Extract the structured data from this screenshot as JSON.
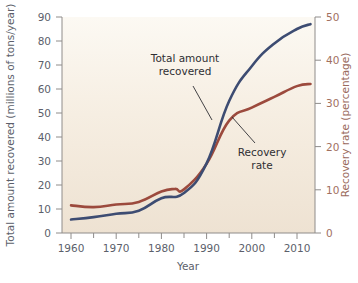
{
  "chart_data": {
    "type": "line",
    "title": "",
    "xlabel": "Year",
    "ylabel": "Total amount recovered (millions of tons/year)",
    "ylabel_right": "Recovery rate (percentage)",
    "xlim": [
      1958,
      2014
    ],
    "ylim": [
      0,
      90
    ],
    "ylim_right": [
      0,
      50
    ],
    "xticks": [
      1960,
      1970,
      1980,
      1990,
      2000,
      2010
    ],
    "xtick_labels": [
      "1960",
      "1970",
      "1980",
      "1990",
      "2000",
      "2010"
    ],
    "xticks_minor": [
      1965,
      1975,
      1985,
      1995,
      2005
    ],
    "yticks": [
      0,
      10,
      20,
      30,
      40,
      50,
      60,
      70,
      80,
      90
    ],
    "ytick_labels": [
      "0",
      "10",
      "20",
      "30",
      "40",
      "50",
      "60",
      "70",
      "80",
      "90"
    ],
    "yticks_right": [
      0,
      10,
      20,
      30,
      40,
      50
    ],
    "ytick_labels_right": [
      "0",
      "10",
      "20",
      "30",
      "40",
      "50"
    ],
    "grid": false,
    "legend_position": "inline-annotations",
    "series": [
      {
        "name": "Total amount recovered",
        "axis": "left",
        "color": "#3d4c72",
        "x": [
          1960,
          1965,
          1970,
          1975,
          1980,
          1985,
          1990,
          1995,
          2000,
          2005,
          2010,
          2013
        ],
        "values": [
          5.6,
          6.6,
          8.0,
          9.3,
          14.5,
          16.7,
          29.0,
          55.0,
          69.5,
          79.0,
          85.0,
          87.0
        ]
      },
      {
        "name": "Recovery rate",
        "axis": "right",
        "color": "#9c4a3d",
        "x": [
          1960,
          1965,
          1970,
          1975,
          1980,
          1983,
          1985,
          1990,
          1995,
          2000,
          2005,
          2010,
          2013
        ],
        "values": [
          6.4,
          6.0,
          6.6,
          7.2,
          9.6,
          10.2,
          10.1,
          16.0,
          26.0,
          29.0,
          31.5,
          34.0,
          34.5
        ]
      }
    ],
    "annotations": [
      {
        "name": "total-amount-recovered",
        "lines": [
          "Total amount",
          "recovered"
        ],
        "text_x": 185,
        "text_y": 62,
        "leader_from": [
          193,
          86
        ],
        "leader_to": [
          212,
          120
        ]
      },
      {
        "name": "recovery-rate",
        "lines": [
          "Recovery",
          "rate"
        ],
        "text_x": 258,
        "text_y": 148,
        "leader_from": [
          255,
          143
        ],
        "leader_to": [
          232,
          117
        ]
      }
    ],
    "colors": {
      "series_total": "#3d4c72",
      "series_rate": "#9c4a3d",
      "plot_background_top": "#fbf7ef",
      "plot_background_bottom": "#efe4d4",
      "axis": "#8f8c8a",
      "left_axis_text": "#5c5f6b",
      "right_axis_text": "#a1705f"
    }
  }
}
